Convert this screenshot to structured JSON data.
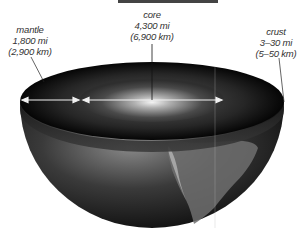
{
  "diagram": {
    "labels": {
      "mantle": {
        "name": "mantle",
        "miles": "1,800 mi",
        "km": "(2,900 km)"
      },
      "core": {
        "name": "core",
        "miles": "4,300 mi",
        "km": "(6,900 km)"
      },
      "crust": {
        "name": "crust",
        "miles": "3–30 mi",
        "km": "(5–50 km)"
      }
    },
    "colors": {
      "background": "#ffffff",
      "shell_dark": "#0e0e0e",
      "core_glow": "#d8d8d8",
      "arrow": "#f2f2f2",
      "leader_line": "#222222",
      "text": "#333333"
    }
  }
}
